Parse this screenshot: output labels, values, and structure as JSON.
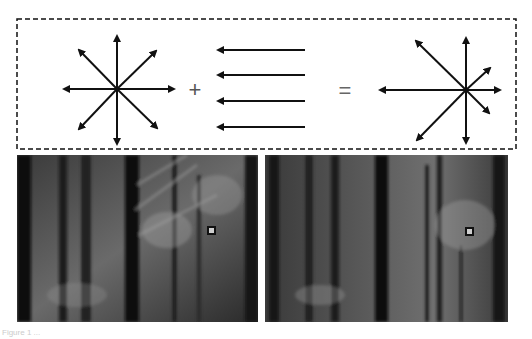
{
  "diagram": {
    "plus_symbol": "+",
    "equals_symbol": "=",
    "left_star": {
      "center": [
        117,
        89
      ],
      "directions": 8,
      "label": "radial expansion flow"
    },
    "translation_arrows": {
      "count": 4,
      "direction": "left",
      "y_positions": [
        50,
        75,
        101,
        127
      ]
    },
    "right_star": {
      "center": [
        466,
        90
      ],
      "label": "shifted focus of expansion"
    }
  },
  "photos": [
    {
      "name": "left-blurred-forest",
      "marker": [
        212,
        231
      ]
    },
    {
      "name": "right-blurred-forest",
      "marker": [
        470,
        232
      ]
    }
  ],
  "caption": "Figure 1 ..."
}
